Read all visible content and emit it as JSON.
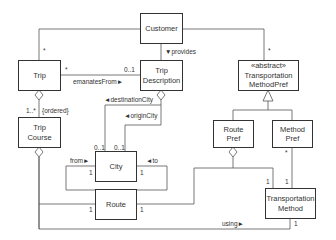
{
  "diagram": {
    "type": "UML class diagram",
    "classes": {
      "customer": {
        "lines": [
          "Customer"
        ]
      },
      "trip": {
        "lines": [
          "Trip"
        ]
      },
      "trip_description": {
        "lines": [
          "Trip",
          "Description"
        ]
      },
      "transportation_method_pref": {
        "lines": [
          "«abstract»",
          "Transportation",
          "MethodPref"
        ]
      },
      "trip_course": {
        "lines": [
          "Trip",
          "Course"
        ]
      },
      "city": {
        "lines": [
          "City"
        ]
      },
      "route": {
        "lines": [
          "Route"
        ]
      },
      "route_pref": {
        "lines": [
          "Route",
          "Pref"
        ]
      },
      "method_pref": {
        "lines": [
          "Method",
          "Pref"
        ]
      },
      "transportation_method": {
        "lines": [
          "Transportation",
          "Method"
        ]
      }
    },
    "labels": {
      "customer_trip_mult": "*",
      "customer_tmp_mult": "*",
      "provides": "▼provides",
      "trip_emanates_mult": "*",
      "tripdesc_emanates_mult": "0..1",
      "emanates_from": "emanatesFrom►",
      "destination_city": "◄destinationCity",
      "origin_city": "◄originCity",
      "trip_course_mult": "1..*",
      "ordered": "{ordered}",
      "city_dest_mult": "0..1",
      "city_origin_mult": "0..1",
      "from": "from►",
      "to": "◄to",
      "city_from_mult": "1",
      "city_to_mult": "1",
      "route_left_mult": "1",
      "route_right_mult": "1",
      "method_pref_mult": "*",
      "tm_routepref_mult": "1",
      "tm_methodpref_mult": "1",
      "tm_using_mult": "1",
      "using": "using►"
    }
  }
}
